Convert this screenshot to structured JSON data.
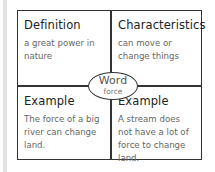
{
  "frayer_model": {
    "center": {
      "label": "Word",
      "word": "force"
    },
    "quadrants": [
      {
        "position": "top-left",
        "heading": "Definition",
        "text": "a great power in nature"
      },
      {
        "position": "top-right",
        "heading": "Characteristics",
        "text": "can move or change things"
      },
      {
        "position": "bottom-left",
        "heading": "Example",
        "text": "The force of a big river can change land."
      },
      {
        "position": "bottom-right",
        "heading": "Example",
        "text": "A stream does not have a lot of force to change land."
      }
    ]
  },
  "colors": {
    "border": "#333333",
    "heading": "#222222",
    "body_text": "#666666",
    "stripe": "#e2e2e2"
  }
}
